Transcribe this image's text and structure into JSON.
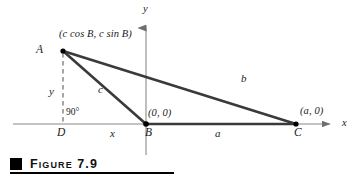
{
  "figure": {
    "caption": "Figure 7.9",
    "caption_marker": "black-square-bullet",
    "colors": {
      "axis": "#8a8a8a",
      "triangle": "#3a3a3a",
      "dashed": "#6b6b6b",
      "point": "#000000",
      "text": "#1a1a1a",
      "caption_marker": "#000000",
      "background": "#ffffff"
    }
  },
  "axes": {
    "x_label": "x",
    "y_label": "y",
    "x_axis": {
      "x1": 13,
      "y1": 124,
      "x2": 336,
      "y2": 124,
      "arrow": "right"
    },
    "y_axis": {
      "x1": 146,
      "y1": 155,
      "x2": 146,
      "y2": 22,
      "arrow": "up"
    }
  },
  "points": [
    {
      "name": "A",
      "label": "A",
      "coord_label": "(c cos B, c sin B)",
      "x": 63,
      "y": 51,
      "dot": true
    },
    {
      "name": "B",
      "label": "B",
      "coord_label": "(0, 0)",
      "x": 146,
      "y": 124,
      "dot": true
    },
    {
      "name": "C",
      "label": "C",
      "coord_label": "(a, 0)",
      "x": 296,
      "y": 124,
      "dot": true
    },
    {
      "name": "D",
      "label": "D",
      "coord_label": "",
      "x": 63,
      "y": 124,
      "dot": false
    }
  ],
  "segments": [
    {
      "name": "side-b",
      "from": "A",
      "to": "C",
      "label": "b",
      "style": "solid",
      "x1": 63,
      "y1": 51,
      "x2": 296,
      "y2": 124
    },
    {
      "name": "side-c",
      "from": "A",
      "to": "B",
      "label": "c",
      "style": "solid",
      "x1": 63,
      "y1": 51,
      "x2": 146,
      "y2": 124
    },
    {
      "name": "side-a",
      "from": "B",
      "to": "C",
      "label": "a",
      "style": "solid",
      "x1": 146,
      "y1": 124,
      "x2": 296,
      "y2": 124
    },
    {
      "name": "height",
      "from": "A",
      "to": "D",
      "label": "y",
      "style": "dashed",
      "x1": 63,
      "y1": 51,
      "x2": 63,
      "y2": 124
    },
    {
      "name": "base-x",
      "from": "D",
      "to": "B",
      "label": "x",
      "style": "none",
      "x1": 63,
      "y1": 124,
      "x2": 146,
      "y2": 124
    }
  ],
  "annotations": {
    "right_angle": "90°",
    "base_segment_label": "x",
    "height_segment_label": "y"
  }
}
